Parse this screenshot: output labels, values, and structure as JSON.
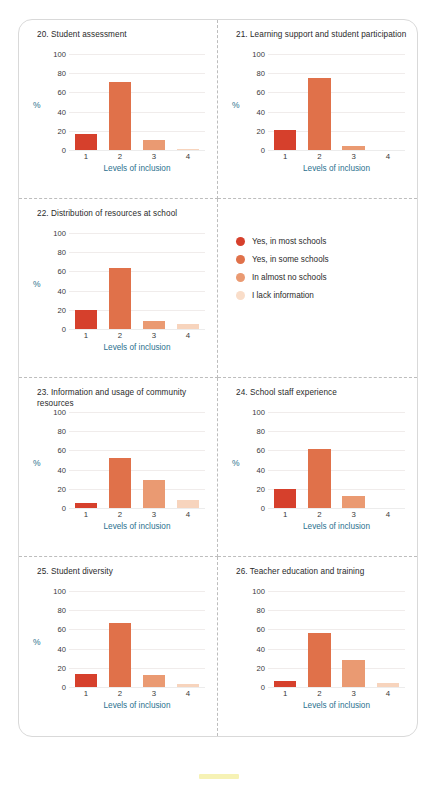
{
  "figure": {
    "axis_title": "Levels of inclusion",
    "percent_symbol": "%",
    "y_ticks": [
      "100",
      "80",
      "60",
      "40",
      "20",
      "0"
    ],
    "x_ticks": [
      "1",
      "2",
      "3",
      "4"
    ],
    "bar_colors": [
      "#d6402c",
      "#e0714a",
      "#ea9a72",
      "#f7d4bd"
    ],
    "axis_label_color": "#2a6f8e",
    "border_color": "#d9d9d9",
    "divider_color": "#bdbdbd",
    "highlight_color": "#f5f0a8"
  },
  "legend": {
    "items": [
      {
        "label": "Yes, in most schools",
        "color": "#d6402c"
      },
      {
        "label": "Yes, in some schools",
        "color": "#e0714a"
      },
      {
        "label": "In almost no schools",
        "color": "#ea9a72"
      },
      {
        "label": "I lack information",
        "color": "#f9ddc9"
      }
    ]
  },
  "chart_data": [
    {
      "type": "bar",
      "id": "chart-20",
      "title": "20. Student assessment",
      "categories": [
        "1",
        "2",
        "3",
        "4"
      ],
      "values": [
        17,
        71,
        10,
        1
      ],
      "xlabel": "Levels of inclusion",
      "ylabel": "%",
      "ylim": [
        0,
        100
      ],
      "yticks": [
        0,
        20,
        40,
        60,
        80,
        100
      ],
      "grid": true,
      "legend_position": "shared-panel"
    },
    {
      "type": "bar",
      "id": "chart-21",
      "title": "21. Learning support and student participation",
      "categories": [
        "1",
        "2",
        "3",
        "4"
      ],
      "values": [
        21,
        75,
        4,
        0
      ],
      "xlabel": "Levels of inclusion",
      "ylabel": "%",
      "ylim": [
        0,
        100
      ],
      "yticks": [
        0,
        20,
        40,
        60,
        80,
        100
      ],
      "grid": true,
      "legend_position": "shared-panel"
    },
    {
      "type": "bar",
      "id": "chart-22",
      "title": "22. Distribution of resources at school",
      "categories": [
        "1",
        "2",
        "3",
        "4"
      ],
      "values": [
        20,
        64,
        8,
        5
      ],
      "xlabel": "Levels of inclusion",
      "ylabel": "%",
      "ylim": [
        0,
        100
      ],
      "yticks": [
        0,
        20,
        40,
        60,
        80,
        100
      ],
      "grid": true,
      "legend_position": "shared-panel"
    },
    {
      "type": "bar",
      "id": "chart-23",
      "title": "23. Information and usage of community resources",
      "categories": [
        "1",
        "2",
        "3",
        "4"
      ],
      "values": [
        5,
        52,
        29,
        8
      ],
      "xlabel": "Levels of inclusion",
      "ylabel": "%",
      "ylim": [
        0,
        100
      ],
      "yticks": [
        0,
        20,
        40,
        60,
        80,
        100
      ],
      "grid": true,
      "legend_position": "shared-panel"
    },
    {
      "type": "bar",
      "id": "chart-24",
      "title": "24. School staff experience",
      "categories": [
        "1",
        "2",
        "3",
        "4"
      ],
      "values": [
        20,
        61,
        13,
        0
      ],
      "xlabel": "Levels of inclusion",
      "ylabel": "%",
      "ylim": [
        0,
        100
      ],
      "yticks": [
        0,
        20,
        40,
        60,
        80,
        100
      ],
      "grid": true,
      "legend_position": "shared-panel"
    },
    {
      "type": "bar",
      "id": "chart-25",
      "title": "25. Student diversity",
      "categories": [
        "1",
        "2",
        "3",
        "4"
      ],
      "values": [
        14,
        67,
        12,
        3
      ],
      "xlabel": "Levels of inclusion",
      "ylabel": "%",
      "ylim": [
        0,
        100
      ],
      "yticks": [
        0,
        20,
        40,
        60,
        80,
        100
      ],
      "grid": true,
      "legend_position": "shared-panel"
    },
    {
      "type": "bar",
      "id": "chart-26",
      "title": "26. Teacher education and training",
      "categories": [
        "1",
        "2",
        "3",
        "4"
      ],
      "values": [
        6,
        56,
        28,
        4
      ],
      "xlabel": "Levels of inclusion",
      "ylabel": "",
      "ylim": [
        0,
        100
      ],
      "yticks": [
        0,
        20,
        40,
        60,
        80,
        100
      ],
      "grid": true,
      "legend_position": "shared-panel"
    }
  ]
}
